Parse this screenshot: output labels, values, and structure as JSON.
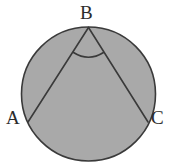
{
  "figure": {
    "background_color": "#ffffff",
    "fill_color": "#a9a9a9",
    "stroke_color": "#3a3a3a",
    "label_color": "#2b2b2b",
    "circle": {
      "name": "circle-outline",
      "center_x": 88.5,
      "center_y": 94,
      "radius": 67,
      "stroke_width": 1.6
    },
    "points": [
      {
        "id": "B",
        "label": "B",
        "x": 88.5,
        "y": 27.5,
        "label_x": 80,
        "label_y": 3
      },
      {
        "id": "A",
        "label": "A",
        "x": 28,
        "y": 122,
        "label_x": 6,
        "label_y": 108
      },
      {
        "id": "C",
        "label": "C",
        "x": 148,
        "y": 122,
        "label_x": 151,
        "label_y": 108
      }
    ],
    "segments": [
      {
        "name": "segment-BA",
        "from": "B",
        "to": "A",
        "stroke_width": 1.6
      },
      {
        "name": "segment-BC",
        "from": "B",
        "to": "C",
        "stroke_width": 1.6
      }
    ],
    "angle_marker": {
      "name": "angle-arc-at-B",
      "vertex": "B",
      "radius": 28,
      "path": "M 73.5,52.5 Q 88.5,62 103.5,52.5",
      "stroke_width": 1.6
    }
  }
}
